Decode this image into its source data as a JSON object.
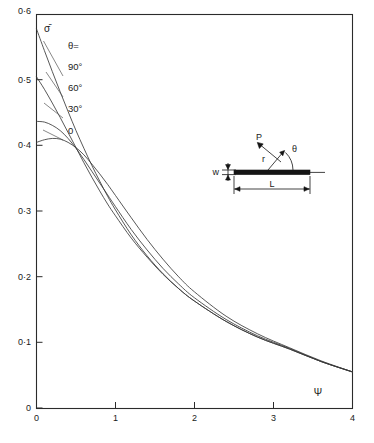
{
  "chart_data": {
    "type": "line",
    "title": "",
    "xlabel": "Ψ",
    "ylabel": "σ̄",
    "xlim": [
      0,
      4
    ],
    "ylim": [
      0,
      0.6
    ],
    "grid": false,
    "legend_position": "upper-left-inside",
    "x_ticks": [
      "0",
      "1",
      "2",
      "3",
      "4"
    ],
    "x_tick_values": [
      0,
      1,
      2,
      3,
      4
    ],
    "y_ticks": [
      "0",
      "0·1",
      "0·2",
      "0·3",
      "0·4",
      "0·5",
      "0·6"
    ],
    "y_tick_values": [
      0,
      0.1,
      0.2,
      0.3,
      0.4,
      0.5,
      0.6
    ],
    "legend_title": "θ=",
    "series": [
      {
        "name": "90°",
        "label": "90°",
        "x": [
          0,
          0.1,
          0.2,
          0.3,
          0.4,
          0.5,
          0.6,
          0.7,
          0.8,
          0.9,
          1.0,
          1.2,
          1.4,
          1.6,
          1.8,
          2.0,
          2.4,
          2.8,
          3.2,
          3.6,
          4.0
        ],
        "y": [
          0.578,
          0.545,
          0.513,
          0.482,
          0.452,
          0.423,
          0.396,
          0.37,
          0.346,
          0.323,
          0.302,
          0.264,
          0.232,
          0.205,
          0.182,
          0.163,
          0.132,
          0.108,
          0.09,
          0.071,
          0.055
        ]
      },
      {
        "name": "60°",
        "label": "60°",
        "x": [
          0,
          0.1,
          0.2,
          0.3,
          0.4,
          0.5,
          0.6,
          0.7,
          0.8,
          0.9,
          1.0,
          1.2,
          1.4,
          1.6,
          1.8,
          2.0,
          2.4,
          2.8,
          3.2,
          3.6,
          4.0
        ],
        "y": [
          0.505,
          0.486,
          0.465,
          0.443,
          0.42,
          0.397,
          0.374,
          0.352,
          0.331,
          0.311,
          0.293,
          0.259,
          0.23,
          0.204,
          0.182,
          0.163,
          0.132,
          0.108,
          0.09,
          0.071,
          0.055
        ]
      },
      {
        "name": "30°",
        "label": "30°",
        "x": [
          0,
          0.1,
          0.2,
          0.3,
          0.4,
          0.5,
          0.6,
          0.7,
          0.8,
          0.9,
          1.0,
          1.2,
          1.4,
          1.6,
          1.8,
          2.0,
          2.4,
          2.8,
          3.2,
          3.6,
          4.0
        ],
        "y": [
          0.437,
          0.436,
          0.431,
          0.423,
          0.411,
          0.396,
          0.379,
          0.361,
          0.343,
          0.325,
          0.307,
          0.272,
          0.241,
          0.213,
          0.189,
          0.168,
          0.135,
          0.11,
          0.091,
          0.071,
          0.055
        ]
      },
      {
        "name": "0",
        "label": "0",
        "x": [
          0,
          0.1,
          0.2,
          0.3,
          0.4,
          0.5,
          0.6,
          0.7,
          0.8,
          0.9,
          1.0,
          1.2,
          1.4,
          1.6,
          1.8,
          2.0,
          2.4,
          2.8,
          3.2,
          3.6,
          4.0
        ],
        "y": [
          0.405,
          0.409,
          0.411,
          0.41,
          0.405,
          0.397,
          0.386,
          0.372,
          0.357,
          0.341,
          0.324,
          0.29,
          0.257,
          0.227,
          0.2,
          0.177,
          0.14,
          0.113,
          0.092,
          0.072,
          0.055
        ]
      }
    ],
    "annotations": [
      {
        "name": "legend-title",
        "text": "θ="
      },
      {
        "name": "y-axis-symbol",
        "text": "σ̄"
      },
      {
        "name": "x-axis-symbol",
        "text": "Ψ"
      }
    ]
  },
  "inset": {
    "name": "beam-loading-diagram",
    "labels": {
      "force": "P",
      "radius": "r",
      "angle": "θ",
      "width": "w",
      "length": "L"
    }
  }
}
